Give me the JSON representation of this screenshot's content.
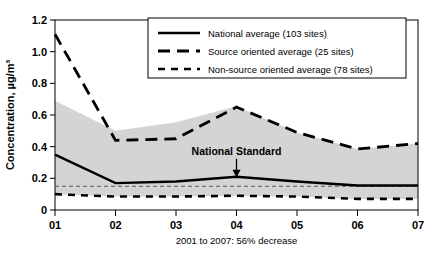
{
  "chart_data": {
    "type": "line",
    "title": "",
    "xlabel": "",
    "ylabel": "Concentration, µg/m³",
    "caption": "2001 to 2007: 56% decrease",
    "categories": [
      "01",
      "02",
      "03",
      "04",
      "05",
      "06",
      "07"
    ],
    "xlim": [
      0,
      6
    ],
    "ylim": [
      0,
      1.2
    ],
    "ytick_labels": [
      "0",
      "0.2",
      "0.4",
      "0.6",
      "0.8",
      "1.0",
      "1.2"
    ],
    "ytick_values": [
      0,
      0.2,
      0.4,
      0.6,
      0.8,
      1.0,
      1.2
    ],
    "xtick_labels": [
      "01",
      "02",
      "03",
      "04",
      "05",
      "06",
      "07"
    ],
    "grid": false,
    "legend_position": "top-right",
    "series": [
      {
        "name": "National average (103 sites)",
        "style": "solid",
        "color": "#000000",
        "values": [
          0.35,
          0.17,
          0.18,
          0.21,
          0.18,
          0.155,
          0.155
        ]
      },
      {
        "name": "Source oriented average (25 sites)",
        "style": "dashed",
        "color": "#000000",
        "values": [
          1.11,
          0.44,
          0.45,
          0.65,
          0.49,
          0.385,
          0.42
        ]
      },
      {
        "name": "Non-source oriented average (78 sites)",
        "style": "fine-dashed",
        "color": "#000000",
        "values": [
          0.1,
          0.085,
          0.085,
          0.09,
          0.085,
          0.07,
          0.07
        ]
      }
    ],
    "band": {
      "name": "range band",
      "fill": "#d4d4d4",
      "upper": [
        0.69,
        0.5,
        0.555,
        0.655,
        0.49,
        0.385,
        0.42
      ],
      "lower": [
        0.1,
        0.085,
        0.085,
        0.09,
        0.085,
        0.07,
        0.07
      ]
    },
    "reference_line": {
      "name": "National Standard",
      "value": 0.15,
      "style": "fine-dashed",
      "color": "#555555"
    },
    "annotations": [
      {
        "name": "national-standard",
        "text": "National Standard",
        "x": 3,
        "y": 0.21,
        "arrow": true
      }
    ]
  },
  "legend": {
    "items": [
      {
        "label": "National average (103 sites)",
        "style": "solid"
      },
      {
        "label": "Source oriented average (25 sites)",
        "style": "dashed"
      },
      {
        "label": "Non-source oriented average (78 sites)",
        "style": "fine-dashed"
      }
    ]
  }
}
